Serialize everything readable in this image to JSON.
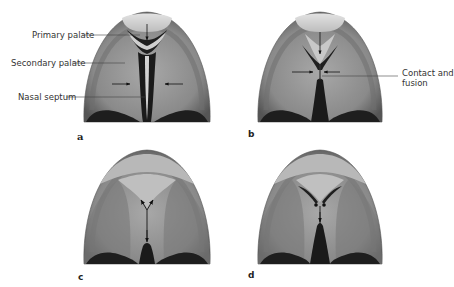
{
  "figure": {
    "panels": [
      {
        "id": "a",
        "letter": "a"
      },
      {
        "id": "b",
        "letter": "b"
      },
      {
        "id": "c",
        "letter": "c"
      },
      {
        "id": "d",
        "letter": "d"
      }
    ],
    "labels": {
      "primary_palate": "Primary palate",
      "secondary_palate": "Secondary palate",
      "nasal_septum": "Nasal septum",
      "contact_fusion_line1": "Contact and",
      "contact_fusion_line2": "fusion"
    },
    "colors": {
      "background": "#ffffff",
      "palate_dark": "#5a5a5a",
      "palate_mid": "#8c8c8c",
      "palate_light": "#b4b4b4",
      "primary_palate": "#d4d4d4",
      "cleft": "#1a1a1a",
      "leader_line": "#444444",
      "text": "#333333"
    }
  }
}
